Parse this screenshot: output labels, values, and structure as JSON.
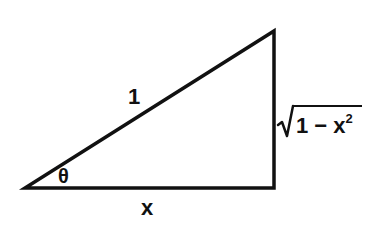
{
  "diagram": {
    "type": "right-triangle",
    "stroke_color": "#111111",
    "background": "#ffffff",
    "vertices": {
      "bottom_left": [
        25,
        188
      ],
      "bottom_right": [
        274,
        188
      ],
      "top_right": [
        274,
        31
      ]
    },
    "labels": {
      "hypotenuse": "1",
      "angle": "θ",
      "adjacent": "x",
      "opposite_radicand": "1 − x",
      "opposite_exponent": "2"
    }
  }
}
